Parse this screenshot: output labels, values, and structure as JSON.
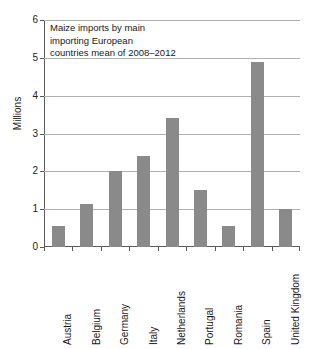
{
  "chart_data": {
    "type": "bar",
    "title_lines": [
      "Maize imports by main",
      "importing European",
      "countries mean of 2008–2012"
    ],
    "categories": [
      "Austria",
      "Belgium",
      "Germany",
      "Italy",
      "Netherlands",
      "Portugal",
      "Romania",
      "Spain",
      "United Kingdom"
    ],
    "values": [
      0.55,
      1.15,
      2.0,
      2.4,
      3.4,
      1.5,
      0.55,
      4.9,
      1.0
    ],
    "xlabel": "",
    "ylabel": "Millions",
    "ylim": [
      0,
      6
    ],
    "ytick_labels": [
      "0",
      "1",
      "2",
      "3",
      "4",
      "5",
      "6"
    ],
    "ytick_values": [
      0,
      1,
      2,
      3,
      4,
      5,
      6
    ],
    "grid": "horizontal",
    "legend": "none",
    "bar_color": "#8a8a8a",
    "grid_color": "#b0b0b0",
    "axis_color": "#5a5a5a"
  }
}
